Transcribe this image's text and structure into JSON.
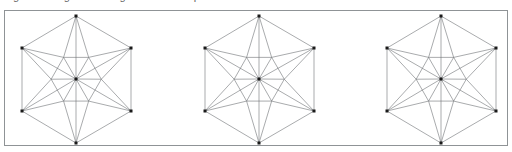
{
  "canvas": {
    "width": 512,
    "height": 152,
    "background": "#ffffff"
  },
  "caption": {
    "text": "Fig. 1  Hexagonal triangulated mesh patterns",
    "visible_fragment": "clipped glyph bottoms only"
  },
  "panel": {
    "border_color": "#8f9396",
    "background": "#ffffff",
    "x": 4,
    "y": 10,
    "width": 504,
    "height": 136
  },
  "style": {
    "line_color": "#6f7276",
    "line_width": 0.6,
    "node_color": "#1a1a1a",
    "node_size": 3
  },
  "figures": [
    {
      "id": "figure-1",
      "label": "hexagon-mesh-a",
      "center": {
        "x": 75,
        "y": 78
      },
      "radius": 63,
      "inner_radius": 26,
      "rotation_deg": 0,
      "vertices": [
        {
          "x": 75,
          "y": 15
        },
        {
          "x": 130,
          "y": 47
        },
        {
          "x": 130,
          "y": 110
        },
        {
          "x": 75,
          "y": 142
        },
        {
          "x": 21,
          "y": 110
        },
        {
          "x": 21,
          "y": 47
        }
      ],
      "petal_count": 6,
      "spoke_count": 12
    },
    {
      "id": "figure-2",
      "label": "hexagon-mesh-b",
      "center": {
        "x": 258,
        "y": 78
      },
      "radius": 63,
      "inner_radius": 26,
      "rotation_deg": 0,
      "vertices": [
        {
          "x": 258,
          "y": 15
        },
        {
          "x": 313,
          "y": 47
        },
        {
          "x": 313,
          "y": 110
        },
        {
          "x": 258,
          "y": 142
        },
        {
          "x": 204,
          "y": 110
        },
        {
          "x": 204,
          "y": 47
        }
      ],
      "petal_count": 6,
      "spoke_count": 12
    },
    {
      "id": "figure-3",
      "label": "hexagon-mesh-c",
      "center": {
        "x": 440,
        "y": 78
      },
      "radius": 63,
      "inner_radius": 26,
      "rotation_deg": 0,
      "vertices": [
        {
          "x": 440,
          "y": 15
        },
        {
          "x": 495,
          "y": 47
        },
        {
          "x": 495,
          "y": 110
        },
        {
          "x": 440,
          "y": 142
        },
        {
          "x": 386,
          "y": 110
        },
        {
          "x": 386,
          "y": 47
        }
      ],
      "petal_count": 6,
      "spoke_count": 12
    }
  ]
}
